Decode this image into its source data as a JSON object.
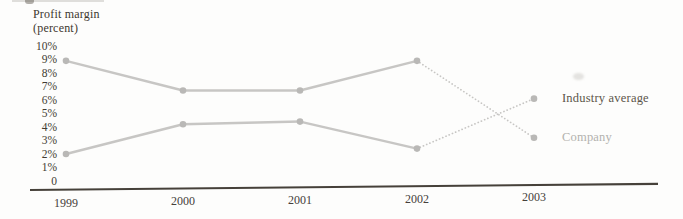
{
  "chart_data": {
    "type": "line",
    "title": "Profit margin (percent)",
    "axis_title_lines": [
      "Profit margin",
      "(percent)"
    ],
    "x_tick_labels": [
      "1999",
      "2000",
      "2001",
      "2002",
      "2003"
    ],
    "y_tick_labels": [
      "10%",
      "9%",
      "8%",
      "7%",
      "6%",
      "5%",
      "4%",
      "3%",
      "2%",
      "1%",
      "0"
    ],
    "y_axis_range": [
      0,
      10
    ],
    "grid": false,
    "legend_position": "right-of-last-point",
    "series": [
      {
        "name": "Industry average",
        "x": [
          1999,
          2000,
          2001,
          2002,
          2003
        ],
        "values": [
          8.9,
          6.7,
          6.7,
          8.9,
          3.2
        ],
        "segment_styles": [
          "solid",
          "solid",
          "solid",
          "dotted"
        ],
        "color": "#c7c6c4",
        "point_color": "#b9b8b6"
      },
      {
        "name": "Company",
        "x": [
          1999,
          2000,
          2001,
          2002,
          2003
        ],
        "values": [
          2.0,
          4.2,
          4.4,
          2.4,
          6.1
        ],
        "segment_styles": [
          "solid",
          "solid",
          "solid",
          "dotted"
        ],
        "color": "#c7c6c4",
        "point_color": "#b9b8b6"
      }
    ],
    "right_labels": [
      {
        "text": "Industry average",
        "at_percent": 6.1,
        "color": "#5c554a"
      },
      {
        "text": "Company",
        "at_percent": 3.2,
        "color": "#b3b2ae"
      }
    ]
  }
}
